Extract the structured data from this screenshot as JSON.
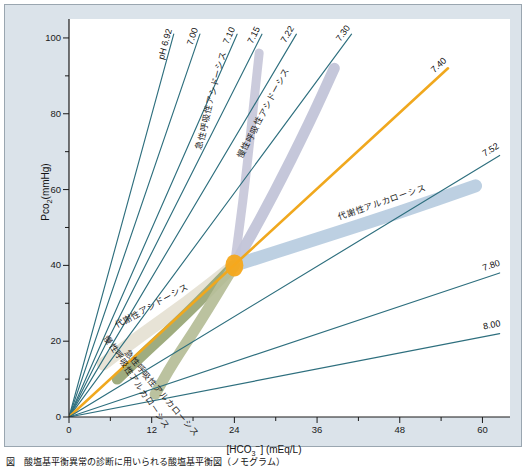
{
  "figure": {
    "title": "",
    "caption": "図　酸塩基平衡異常の診断に用いられる酸塩基平衡図（ノモグラム）",
    "panel_color": "#dbe3ea",
    "paper_color": "#ffffff"
  },
  "axes": {
    "x": {
      "label_html": "[HCO<sub>3</sub><sup>−</sup>] (mEq/L)",
      "label_text": "[HCO3-] (mEq/L)",
      "ticks": [
        0,
        12,
        24,
        36,
        48,
        60
      ],
      "min": 0,
      "max": 64,
      "minor_step": 6
    },
    "y": {
      "label_text": "Pco2(mmHg)",
      "ticks": [
        0,
        20,
        40,
        60,
        80,
        100
      ],
      "min": 0,
      "max": 105,
      "minor_step": 10
    }
  },
  "chart_data": {
    "type": "line",
    "title": "酸塩基平衡図（ノモグラム）",
    "xlabel": "[HCO3-] (mEq/L)",
    "ylabel": "Pco2(mmHg)",
    "xlim": [
      0,
      64
    ],
    "ylim": [
      0,
      105
    ],
    "grid": false,
    "legend": "none",
    "normal_point": {
      "label": "normal",
      "hco3": 24,
      "pco2": 40,
      "color": "#f5a81c"
    },
    "ph_isobars": [
      {
        "ph": "pH 6.92",
        "value": 6.92,
        "x_end": 15.2,
        "y_end": 101.0,
        "color": "#2e6f7e",
        "highlight": false
      },
      {
        "ph": "7.00",
        "value": 7.0,
        "x_end": 19.0,
        "y_end": 101.0,
        "color": "#2e6f7e",
        "highlight": false
      },
      {
        "ph": "7.10",
        "value": 7.1,
        "x_end": 24.4,
        "y_end": 101.0,
        "color": "#2e6f7e",
        "highlight": false
      },
      {
        "ph": "7.15",
        "value": 7.15,
        "x_end": 28.0,
        "y_end": 101.0,
        "color": "#2e6f7e",
        "highlight": false
      },
      {
        "ph": "7.22",
        "value": 7.22,
        "x_end": 33.0,
        "y_end": 101.0,
        "color": "#2e6f7e",
        "highlight": false
      },
      {
        "ph": "7.30",
        "value": 7.3,
        "x_end": 41.0,
        "y_end": 101.0,
        "color": "#2e6f7e",
        "highlight": false
      },
      {
        "ph": "7.40",
        "value": 7.4,
        "x_end": 55.0,
        "y_end": 92.0,
        "color": "#f0a81e",
        "highlight": true
      },
      {
        "ph": "7.52",
        "value": 7.52,
        "x_end": 62.5,
        "y_end": 69.0,
        "color": "#2e6f7e",
        "highlight": false
      },
      {
        "ph": "7.80",
        "value": 7.8,
        "x_end": 62.5,
        "y_end": 38.0,
        "color": "#2e6f7e",
        "highlight": false
      },
      {
        "ph": "8.00",
        "value": 8.0,
        "x_end": 62.5,
        "y_end": 22.0,
        "color": "#2e6f7e",
        "highlight": false
      }
    ],
    "disorder_bands": [
      {
        "name": "急性呼吸性アシドーシス",
        "romaji": "acute respiratory acidosis",
        "color": "#c8c8da",
        "label_rotation": -76,
        "points": [
          [
            24,
            40
          ],
          [
            25.6,
            62
          ],
          [
            27.0,
            86
          ],
          [
            27.6,
            96
          ]
        ]
      },
      {
        "name": "慢性呼吸性アシドーシス",
        "romaji": "chronic respiratory acidosis",
        "color": "#c2c4d8",
        "label_rotation": -62,
        "points": [
          [
            24,
            40
          ],
          [
            29.5,
            58
          ],
          [
            35.0,
            78
          ],
          [
            38.5,
            92
          ]
        ]
      },
      {
        "name": "代謝性アルカローシス",
        "romaji": "metabolic alkalosis",
        "color": "#b9cde0",
        "label_rotation": -19,
        "points": [
          [
            24,
            40
          ],
          [
            36,
            47
          ],
          [
            48,
            54
          ],
          [
            59,
            61
          ]
        ]
      },
      {
        "name": "代謝性アシドーシス",
        "romaji": "metabolic acidosis",
        "color": "#e6e2d4",
        "label_rotation": -29,
        "points": [
          [
            24,
            40
          ],
          [
            17,
            30
          ],
          [
            10,
            21
          ],
          [
            5,
            14
          ]
        ]
      },
      {
        "name": "慢性呼吸性アルカローシス",
        "romaji": "chronic respiratory alkalosis",
        "color": "#9aa878",
        "label_rotation": 56,
        "points": [
          [
            24,
            40
          ],
          [
            17,
            27
          ],
          [
            11,
            17
          ],
          [
            7,
            10
          ]
        ]
      },
      {
        "name": "急性呼吸性アルカローシス",
        "romaji": "acute respiratory alkalosis",
        "color": "#b7bf9a",
        "label_rotation": 50,
        "points": [
          [
            24,
            40
          ],
          [
            19,
            25
          ],
          [
            15,
            14
          ],
          [
            12.5,
            6
          ]
        ]
      }
    ]
  }
}
